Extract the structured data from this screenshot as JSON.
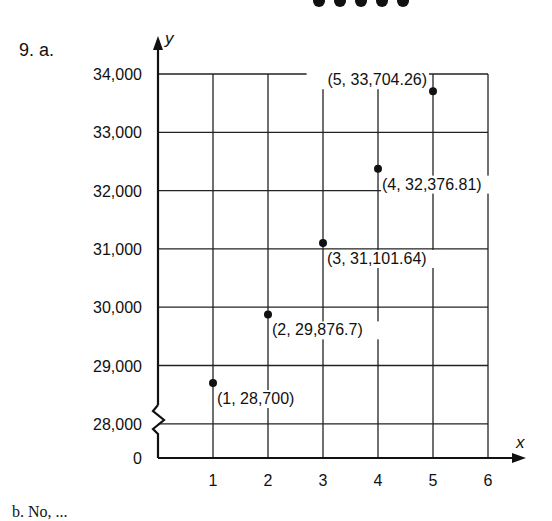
{
  "problem_label": "9. a.",
  "footer_text": "b. No, ...",
  "chart_data": {
    "type": "scatter",
    "title": "",
    "xlabel": "x",
    "ylabel": "y",
    "x_ticks": [
      "1",
      "2",
      "3",
      "4",
      "5",
      "6"
    ],
    "y_ticks": [
      "0",
      "28,000",
      "29,000",
      "30,000",
      "31,000",
      "32,000",
      "33,000",
      "34,000"
    ],
    "y_axis_break": true,
    "xlim": [
      0,
      6
    ],
    "ylim": [
      28000,
      34000
    ],
    "grid": true,
    "points": [
      {
        "x": 1,
        "y": 28700,
        "label": "(1, 28,700)"
      },
      {
        "x": 2,
        "y": 29876.7,
        "label": "(2, 29,876.7)"
      },
      {
        "x": 3,
        "y": 31101.64,
        "label": "(3, 31,101.64)"
      },
      {
        "x": 4,
        "y": 32376.81,
        "label": "(4, 32,376.81)"
      },
      {
        "x": 5,
        "y": 33704.26,
        "label": "(5, 33,704.26)"
      }
    ]
  }
}
